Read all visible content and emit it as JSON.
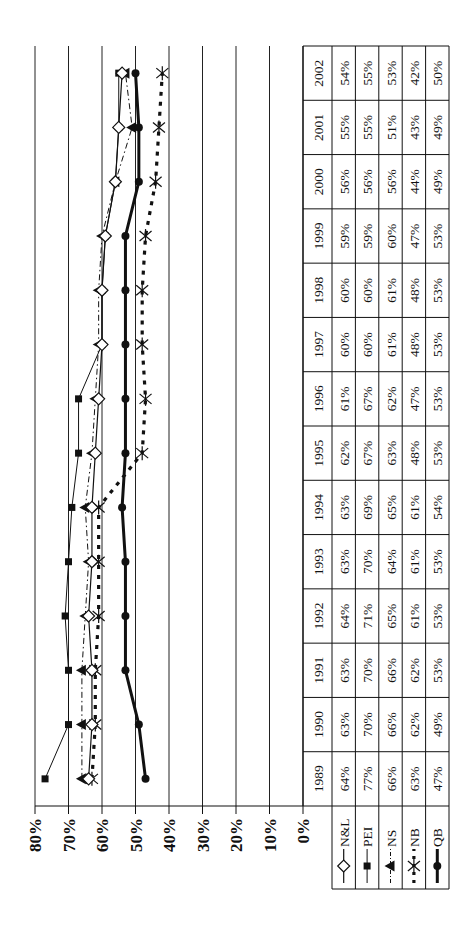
{
  "chart_data": {
    "type": "line",
    "title": "",
    "xlabel": "",
    "ylabel": "",
    "orientation": "rotated 90deg counter-clockwise",
    "ylim": [
      0,
      80
    ],
    "yticks": [
      "0%",
      "10%",
      "20%",
      "30%",
      "40%",
      "50%",
      "60%",
      "70%",
      "80%"
    ],
    "grid": true,
    "legend_position": "data table (left column)",
    "categories": [
      "1989",
      "1990",
      "1991",
      "1992",
      "1993",
      "1994",
      "1995",
      "1996",
      "1997",
      "1998",
      "1999",
      "2000",
      "2001",
      "2002"
    ],
    "series": [
      {
        "name": "N&L",
        "marker": "diamond-open",
        "line": "solid-thin",
        "values": [
          64,
          63,
          63,
          64,
          63,
          63,
          62,
          61,
          60,
          60,
          59,
          56,
          55,
          54
        ]
      },
      {
        "name": "PEI",
        "marker": "square",
        "line": "solid-thin",
        "values": [
          77,
          70,
          70,
          71,
          70,
          69,
          67,
          67,
          60,
          60,
          59,
          56,
          55,
          55
        ]
      },
      {
        "name": "NS",
        "marker": "triangle",
        "line": "dash-dot",
        "values": [
          66,
          66,
          66,
          65,
          64,
          65,
          63,
          62,
          61,
          61,
          60,
          56,
          51,
          53
        ]
      },
      {
        "name": "NB",
        "marker": "asterisk",
        "line": "dotted-thick",
        "values": [
          63,
          62,
          62,
          61,
          61,
          61,
          48,
          47,
          48,
          48,
          47,
          44,
          43,
          42
        ]
      },
      {
        "name": "QB",
        "marker": "circle",
        "line": "solid-thick",
        "values": [
          47,
          49,
          53,
          53,
          53,
          54,
          53,
          53,
          53,
          53,
          53,
          49,
          49,
          50
        ]
      }
    ]
  },
  "table": {
    "years": [
      "1989",
      "1990",
      "1991",
      "1992",
      "1993",
      "1994",
      "1995",
      "1996",
      "1997",
      "1998",
      "1999",
      "2000",
      "2001",
      "2002"
    ],
    "rows": [
      {
        "label": "N&L",
        "cells": [
          "64%",
          "63%",
          "63%",
          "64%",
          "63%",
          "63%",
          "62%",
          "61%",
          "60%",
          "60%",
          "59%",
          "56%",
          "55%",
          "54%"
        ]
      },
      {
        "label": "PEI",
        "cells": [
          "77%",
          "70%",
          "70%",
          "71%",
          "70%",
          "69%",
          "67%",
          "67%",
          "60%",
          "60%",
          "59%",
          "56%",
          "55%",
          "55%"
        ]
      },
      {
        "label": "NS",
        "cells": [
          "66%",
          "66%",
          "66%",
          "65%",
          "64%",
          "65%",
          "63%",
          "62%",
          "61%",
          "61%",
          "60%",
          "56%",
          "51%",
          "53%"
        ]
      },
      {
        "label": "NB",
        "cells": [
          "63%",
          "62%",
          "62%",
          "61%",
          "61%",
          "61%",
          "48%",
          "47%",
          "48%",
          "48%",
          "47%",
          "44%",
          "43%",
          "42%"
        ]
      },
      {
        "label": "QB",
        "cells": [
          "47%",
          "49%",
          "53%",
          "53%",
          "53%",
          "54%",
          "53%",
          "53%",
          "53%",
          "53%",
          "53%",
          "49%",
          "49%",
          "50%"
        ]
      }
    ]
  },
  "colors": {
    "ink": "#111111",
    "grid": "#222222",
    "background": "#ffffff"
  }
}
